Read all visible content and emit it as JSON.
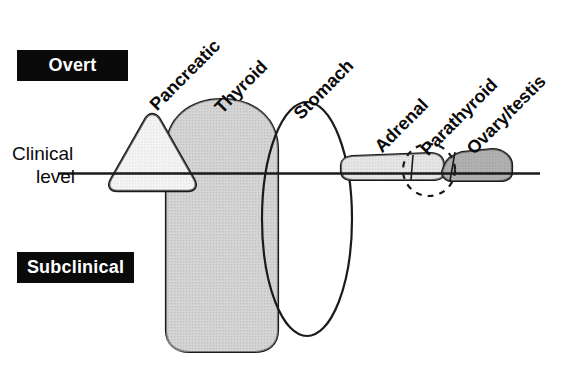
{
  "figure": {
    "type": "conceptual-diagram",
    "axis": {
      "clinical_level_line_1": "Clinical",
      "clinical_level_line_2": "level"
    },
    "banners": {
      "overt": "Overt",
      "subclinical": "Subclinical"
    },
    "organs": [
      {
        "id": "pancreatic",
        "label": "Pancreatic",
        "shape": "triangle",
        "fill": "#eeeeee"
      },
      {
        "id": "thyroid",
        "label": "Thyroid",
        "shape": "rounded-dome",
        "fill": "#b3b3b3"
      },
      {
        "id": "stomach",
        "label": "Stomach",
        "shape": "ellipse",
        "fill": "none"
      },
      {
        "id": "adrenal",
        "label": "Adrenal",
        "shape": "flat-lens",
        "fill": "#d6d6d6"
      },
      {
        "id": "parathyroid",
        "label": "Parathyroid",
        "shape": "dashed-circle",
        "fill": "none"
      },
      {
        "id": "ovary-testis",
        "label": "Ovary/testis",
        "shape": "flat-lens",
        "fill": "#8c8c8c"
      }
    ],
    "colors": {
      "ink": "#0a0a0a",
      "banner_bg": "#0a0a0a",
      "banner_text": "#ffffff",
      "pancreatic_fill": "#eeeeee",
      "thyroid_fill": "#b3b3b3",
      "stomach_fill": "#ffffff",
      "adrenal_fill": "#d6d6d6",
      "ovary_testis_fill": "#8c8c8c",
      "background": "#ffffff"
    }
  }
}
